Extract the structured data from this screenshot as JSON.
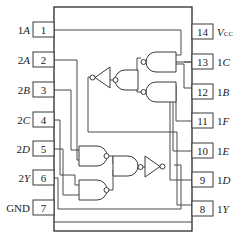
{
  "diagram": {
    "title": "",
    "left_pins": [
      {
        "num": "1",
        "prefix": "1",
        "letter": "A"
      },
      {
        "num": "2",
        "prefix": "2",
        "letter": "A"
      },
      {
        "num": "3",
        "prefix": "2",
        "letter": "B"
      },
      {
        "num": "4",
        "prefix": "2",
        "letter": "C"
      },
      {
        "num": "5",
        "prefix": "2",
        "letter": "D"
      },
      {
        "num": "6",
        "prefix": "2",
        "letter": "Y"
      },
      {
        "num": "7",
        "prefix": "GND",
        "letter": ""
      }
    ],
    "right_pins": [
      {
        "num": "14",
        "prefix": "",
        "letter": "V",
        "sub": "CC"
      },
      {
        "num": "13",
        "prefix": "1",
        "letter": "C"
      },
      {
        "num": "12",
        "prefix": "1",
        "letter": "B"
      },
      {
        "num": "11",
        "prefix": "1",
        "letter": "F"
      },
      {
        "num": "10",
        "prefix": "1",
        "letter": "E"
      },
      {
        "num": "9",
        "prefix": "1",
        "letter": "D"
      },
      {
        "num": "8",
        "prefix": "1",
        "letter": "Y"
      }
    ],
    "gates": [
      {
        "id": "nand-13",
        "type": "NAND",
        "group": 1
      },
      {
        "id": "nand-12",
        "type": "NAND",
        "group": 1
      },
      {
        "id": "nand-1mid",
        "type": "NAND",
        "group": 1
      },
      {
        "id": "not-1",
        "type": "NOT",
        "group": 1
      },
      {
        "id": "nand-2a",
        "type": "NAND",
        "group": 2
      },
      {
        "id": "nand-2b",
        "type": "NAND",
        "group": 2
      },
      {
        "id": "nand-2mid",
        "type": "NAND",
        "group": 2
      },
      {
        "id": "not-2",
        "type": "NOT",
        "group": 2
      }
    ]
  }
}
